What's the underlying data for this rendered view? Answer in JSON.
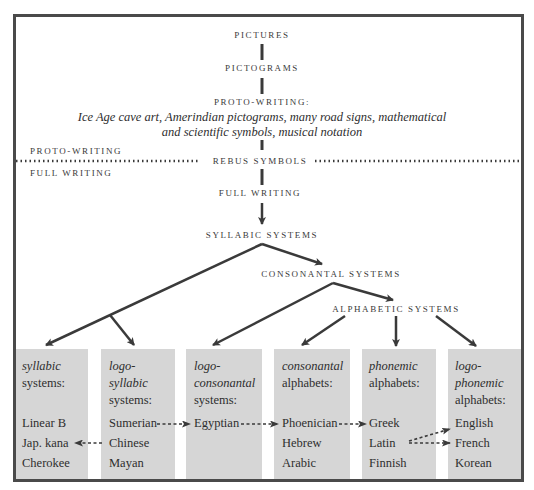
{
  "diagram": {
    "chain": {
      "pictures": "PICTURES",
      "pictograms": "PICTOGRAMS",
      "proto_writing": "PROTO-WRITING:",
      "proto_examples_line1": "Ice Age cave art, Amerindian pictograms, many road signs, mathematical",
      "proto_examples_line2": "and scientific symbols, musical notation",
      "rebus_symbols": "REBUS SYMBOLS",
      "full_writing": "FULL WRITING",
      "syllabic_systems": "SYLLABIC SYSTEMS",
      "consonantal_systems": "CONSONANTAL SYSTEMS",
      "alphabetic_systems": "ALPHABETIC SYSTEMS"
    },
    "divider": {
      "above_label": "PROTO-WRITING",
      "below_label": "FULL WRITING"
    },
    "categories": [
      {
        "line1": "syllabic",
        "line1_italic": true,
        "line2": "systems:",
        "line2_italic": false,
        "line3": "",
        "line3_italic": false,
        "items": [
          "Linear B",
          "Jap. kana",
          "Cherokee"
        ]
      },
      {
        "line1": "logo-",
        "line1_italic": true,
        "line2": "syllabic",
        "line2_italic": true,
        "line3": "systems:",
        "line3_italic": false,
        "items": [
          "Sumerian",
          "Chinese",
          "Mayan"
        ]
      },
      {
        "line1": "logo-",
        "line1_italic": true,
        "line2": "consonantal",
        "line2_italic": true,
        "line3": "systems:",
        "line3_italic": false,
        "items": [
          "Egyptian",
          "",
          ""
        ]
      },
      {
        "line1": "consonantal",
        "line1_italic": true,
        "line2": "alphabets:",
        "line2_italic": false,
        "line3": "",
        "line3_italic": false,
        "items": [
          "Phoenician",
          "Hebrew",
          "Arabic"
        ]
      },
      {
        "line1": "phonemic",
        "line1_italic": true,
        "line2": "alphabets:",
        "line2_italic": false,
        "line3": "",
        "line3_italic": false,
        "items": [
          "Greek",
          "Latin",
          "Finnish"
        ]
      },
      {
        "line1": "logo-",
        "line1_italic": true,
        "line2": "phonemic",
        "line2_italic": true,
        "line3": "alphabets:",
        "line3_italic": false,
        "items": [
          "English",
          "French",
          "Korean"
        ]
      }
    ],
    "influences": [
      {
        "from": "Chinese",
        "to": "Jap. kana"
      },
      {
        "from": "Sumerian",
        "to": "Egyptian"
      },
      {
        "from": "Egyptian",
        "to": "Phoenician"
      },
      {
        "from": "Phoenician",
        "to": "Greek"
      },
      {
        "from": "Latin",
        "to": "English"
      },
      {
        "from": "Latin",
        "to": "French"
      }
    ],
    "colors": {
      "frame": "#4a4a4a",
      "box_fill": "#d6d6d6",
      "line": "#3a3a3a",
      "text": "#2e2e2e"
    }
  }
}
